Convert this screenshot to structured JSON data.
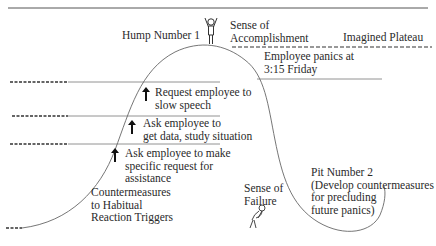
{
  "diagram": {
    "colors": {
      "ink": "#2a2a2a",
      "line": "#555555",
      "background": "#ffffff"
    },
    "labels": {
      "hump": "Hump Number 1",
      "accomplishment": [
        "Sense of",
        "Accomplishment"
      ],
      "plateau": "Imagined Plateau",
      "panic": [
        "Employee panics at",
        "3:15 Friday"
      ],
      "step1": [
        "Request employee to",
        "slow speech"
      ],
      "step2": [
        "Ask employee to",
        "get data, study situation"
      ],
      "step3": [
        "Ask employee to make",
        "specific request for",
        "assistance"
      ],
      "countermeasures": [
        "Countermeasures",
        "to Habitual",
        "Reaction Triggers"
      ],
      "failure": [
        "Sense of",
        "Failure"
      ],
      "pit": [
        "Pit Number 2",
        "(Develop countermeasures",
        "for precluding",
        "future panics)"
      ]
    },
    "icons": {
      "happy_figure": "stick-figure-arms-raised",
      "sad_figure": "stick-figure-slumped",
      "step_arrow": "up-arrow"
    }
  }
}
